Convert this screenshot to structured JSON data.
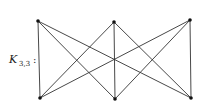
{
  "diagram": {
    "label_main": "K",
    "label_sub": "3,3",
    "label_colon": ":",
    "edge_color": "#333333",
    "vertex_color": "#111111",
    "vertices": {
      "top": [
        [
          38,
          21
        ],
        [
          114,
          22
        ],
        [
          190,
          20
        ]
      ],
      "bottom": [
        [
          40,
          98
        ],
        [
          115,
          99
        ],
        [
          191,
          98
        ]
      ]
    }
  }
}
